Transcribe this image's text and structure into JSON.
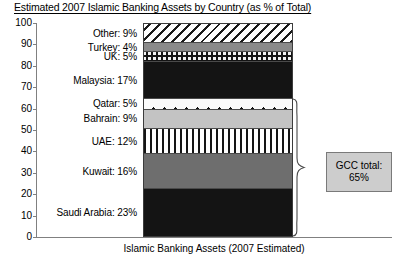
{
  "chart_data": {
    "type": "bar",
    "subtype": "stacked-single-column",
    "title": "Estimated 2007 Islamic Banking Assets by Country (as % of Total)",
    "xlabel": "Islamic Banking Assets (2007 Estimated)",
    "ylabel": "",
    "ylim": [
      0,
      100
    ],
    "ytick_labels": [
      "100",
      "90",
      "80",
      "70",
      "60",
      "50",
      "40",
      "30",
      "20",
      "10",
      "0"
    ],
    "ytick_values": [
      100,
      90,
      80,
      70,
      60,
      50,
      40,
      30,
      20,
      10,
      0
    ],
    "grid": false,
    "legend": "none (inline segment labels)",
    "categories": [
      "Islamic Banking Assets (2007 Estimated)"
    ],
    "stack_order_bottom_to_top": [
      "Saudi Arabia",
      "Kuwait",
      "UAE",
      "Bahrain",
      "Qatar",
      "Malaysia",
      "UK",
      "Turkey",
      "Other"
    ],
    "segments": [
      {
        "name": "Other",
        "label": "Other: 9%",
        "value": 9,
        "cumulative_top": 100,
        "cumulative_bottom": 91,
        "pattern": "diagonal-hatch",
        "fill": "#ffffff",
        "ink": "#1a1a1a"
      },
      {
        "name": "Turkey",
        "label": "Turkey: 4%",
        "value": 4,
        "cumulative_top": 91,
        "cumulative_bottom": 87,
        "pattern": "solid",
        "fill": "#8a8a8a",
        "ink": "#8a8a8a"
      },
      {
        "name": "UK",
        "label": "UK: 5%",
        "value": 5,
        "cumulative_top": 87,
        "cumulative_bottom": 82,
        "pattern": "checker-dot",
        "fill": "#f2f2f2",
        "ink": "#141414"
      },
      {
        "name": "Malaysia",
        "label": "Malaysia: 17%",
        "value": 17,
        "cumulative_top": 82,
        "cumulative_bottom": 65,
        "pattern": "solid",
        "fill": "#141414",
        "ink": "#141414"
      },
      {
        "name": "Qatar",
        "label": "Qatar: 5%",
        "value": 5,
        "cumulative_top": 65,
        "cumulative_bottom": 60,
        "pattern": "sparse-dots",
        "fill": "#fbfbfb",
        "ink": "#111111"
      },
      {
        "name": "Bahrain",
        "label": "Bahrain: 9%",
        "value": 9,
        "cumulative_top": 60,
        "cumulative_bottom": 51,
        "pattern": "solid",
        "fill": "#c3c3c3",
        "ink": "#c3c3c3"
      },
      {
        "name": "UAE",
        "label": "UAE: 12%",
        "value": 12,
        "cumulative_top": 51,
        "cumulative_bottom": 39,
        "pattern": "vertical-stripes",
        "fill": "#ffffff",
        "ink": "#151515"
      },
      {
        "name": "Kuwait",
        "label": "Kuwait: 16%",
        "value": 16,
        "cumulative_top": 39,
        "cumulative_bottom": 23,
        "pattern": "solid",
        "fill": "#6e6e6e",
        "ink": "#6e6e6e"
      },
      {
        "name": "Saudi Arabia",
        "label": "Saudi Arabia: 23%",
        "value": 23,
        "cumulative_top": 23,
        "cumulative_bottom": 0,
        "pattern": "solid",
        "fill": "#141414",
        "ink": "#141414"
      }
    ],
    "annotations": [
      {
        "name": "gcc-total",
        "line1": "GCC total:",
        "line2": "65%",
        "value": 65,
        "covers": [
          "Qatar",
          "Bahrain",
          "UAE",
          "Kuwait",
          "Saudi Arabia"
        ],
        "brace_span_percent": [
          0,
          65
        ],
        "box_fill": "#cdcdcd",
        "box_border": "#7a7a7a"
      }
    ]
  },
  "gcc_callout": {
    "line1": "GCC total:",
    "line2": "65%"
  }
}
